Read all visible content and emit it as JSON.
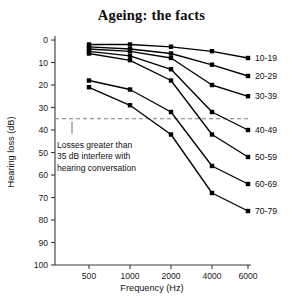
{
  "chart_data": {
    "type": "line",
    "title": "Ageing: the facts",
    "xlabel": "Frequency (Hz)",
    "ylabel": "Hearing loss (dB)",
    "categories": [
      "500",
      "1000",
      "2000",
      "4000",
      "6000"
    ],
    "x_tick_labels": [
      "500",
      "1000",
      "2000",
      "4000",
      "6000"
    ],
    "y_tick_labels": [
      "0",
      "10",
      "20",
      "30",
      "40",
      "50",
      "60",
      "70",
      "80",
      "90",
      "100"
    ],
    "ylim": [
      0,
      100
    ],
    "y_inverted": true,
    "grid": false,
    "legend_position": "right-inline",
    "series": [
      {
        "name": "10-19",
        "values": [
          2,
          2,
          3,
          5,
          8
        ]
      },
      {
        "name": "20-29",
        "values": [
          3,
          4,
          6,
          11,
          16
        ]
      },
      {
        "name": "30-39",
        "values": [
          4,
          5,
          8,
          20,
          25
        ]
      },
      {
        "name": "40-49",
        "values": [
          5,
          7,
          13,
          32,
          40
        ]
      },
      {
        "name": "50-59",
        "values": [
          6,
          9,
          18,
          42,
          52
        ]
      },
      {
        "name": "60-69",
        "values": [
          18,
          22,
          32,
          56,
          64
        ]
      },
      {
        "name": "70-79",
        "values": [
          21,
          29,
          42,
          68,
          76
        ]
      }
    ],
    "annotations": [
      {
        "name": "threshold-line",
        "value": 35,
        "style": "dashed",
        "text": "Losses greater than 35 dB interfere with hearing conversation",
        "text_lines": [
          "Losses greater than",
          "35 dB interfere with",
          "hearing conversation"
        ]
      }
    ],
    "colors": {
      "line": "#000000",
      "marker": "#000000",
      "threshold": "#7d7d7d",
      "axis": "#3a3a3a",
      "background": "#ffffff"
    }
  }
}
